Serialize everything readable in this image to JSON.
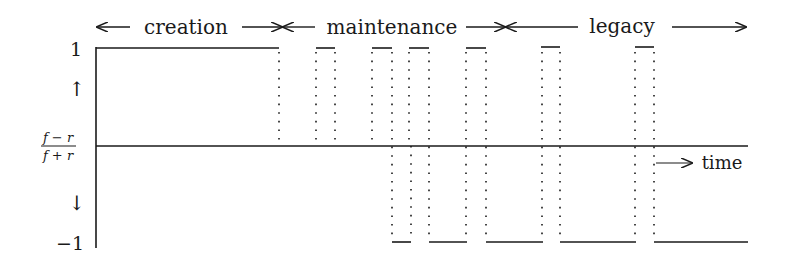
{
  "phases": [
    {
      "label": "creation",
      "x_start": 96,
      "x_end": 282
    },
    {
      "label": "maintenance",
      "x_start": 282,
      "x_end": 505
    },
    {
      "label": "legacy",
      "x_start": 505,
      "x_end": 748
    }
  ],
  "axis": {
    "y_top_label": "1",
    "y_bottom_label": "−1",
    "y_middle_label_numerator": "f − r",
    "y_middle_label_denominator": "f + r",
    "up_arrow": "↑",
    "down_arrow": "↓",
    "x_label": "time",
    "x_arrow": "⟶"
  },
  "signal": {
    "description": "Value of (f−r)/(f+r) over time: +1 during creation, then alternating pulses between +1 and −1 during maintenance and legacy",
    "segments": [
      {
        "level": 1,
        "x_start": 96,
        "x_end": 279
      },
      {
        "level": 1,
        "x_start": 316,
        "x_end": 335
      },
      {
        "level": 1,
        "x_start": 372,
        "x_end": 392
      },
      {
        "level": 1,
        "x_start": 409,
        "x_end": 429
      },
      {
        "level": 1,
        "x_start": 466,
        "x_end": 486
      },
      {
        "level": 1,
        "x_start": 541,
        "x_end": 560
      },
      {
        "level": 1,
        "x_start": 635,
        "x_end": 654
      },
      {
        "level": -1,
        "x_start": 392,
        "x_end": 411
      },
      {
        "level": -1,
        "x_start": 429,
        "x_end": 467
      },
      {
        "level": -1,
        "x_start": 486,
        "x_end": 543
      },
      {
        "level": -1,
        "x_start": 560,
        "x_end": 636
      },
      {
        "level": -1,
        "x_start": 654,
        "x_end": 748
      }
    ]
  }
}
